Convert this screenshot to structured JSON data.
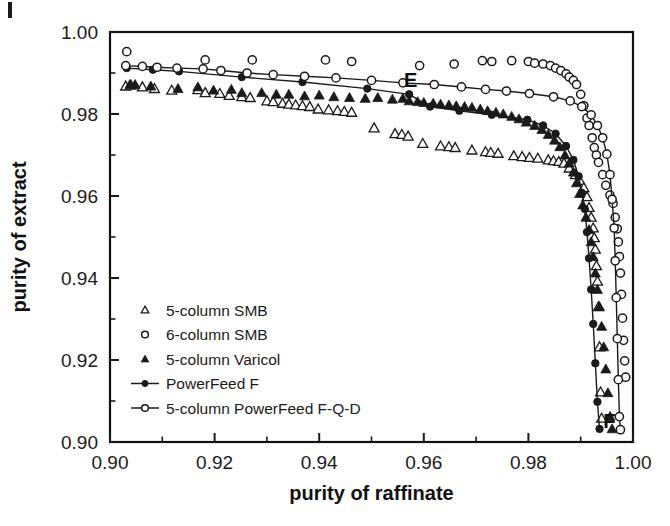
{
  "chart_data": {
    "type": "scatter",
    "title": "",
    "xlabel": "purity of raffinate",
    "ylabel": "purity of extract",
    "xlim": [
      0.9,
      1.0
    ],
    "ylim": [
      0.9,
      1.0
    ],
    "xticks": [
      "0.90",
      "0.92",
      "0.94",
      "0.96",
      "0.98",
      "1.00"
    ],
    "xtick_values": [
      0.9,
      0.92,
      0.94,
      0.96,
      0.98,
      1.0
    ],
    "yticks": [
      "0.90",
      "0.92",
      "0.94",
      "0.96",
      "0.98",
      "1.00"
    ],
    "ytick_values": [
      0.9,
      0.92,
      0.94,
      0.96,
      0.98,
      1.0
    ],
    "minor_tick_step": 0.01,
    "grid": false,
    "legend_position": "lower-left",
    "annotations": [
      {
        "text": "E",
        "x": 0.9575,
        "y": 0.9865
      },
      {
        "text": "F",
        "x": 0.9955,
        "y": 0.9035
      }
    ],
    "series": [
      {
        "name": "5-column SMB",
        "marker": "open-triangle",
        "line": false,
        "points": [
          [
            0.903,
            0.9868
          ],
          [
            0.904,
            0.987
          ],
          [
            0.9062,
            0.9866
          ],
          [
            0.9085,
            0.9862
          ],
          [
            0.9118,
            0.9858
          ],
          [
            0.9168,
            0.9859
          ],
          [
            0.9182,
            0.9852
          ],
          [
            0.921,
            0.985
          ],
          [
            0.9228,
            0.9845
          ],
          [
            0.9252,
            0.9842
          ],
          [
            0.9268,
            0.984
          ],
          [
            0.93,
            0.9832
          ],
          [
            0.9312,
            0.983
          ],
          [
            0.933,
            0.9826
          ],
          [
            0.9342,
            0.9824
          ],
          [
            0.9355,
            0.9822
          ],
          [
            0.9368,
            0.982
          ],
          [
            0.9382,
            0.9818
          ],
          [
            0.9398,
            0.9812
          ],
          [
            0.9418,
            0.981
          ],
          [
            0.9435,
            0.9808
          ],
          [
            0.9448,
            0.9806
          ],
          [
            0.9462,
            0.9804
          ],
          [
            0.9505,
            0.9766
          ],
          [
            0.9545,
            0.9752
          ],
          [
            0.9558,
            0.975
          ],
          [
            0.957,
            0.9746
          ],
          [
            0.9598,
            0.9728
          ],
          [
            0.9632,
            0.9722
          ],
          [
            0.9648,
            0.972
          ],
          [
            0.966,
            0.9718
          ],
          [
            0.9692,
            0.9712
          ],
          [
            0.9718,
            0.9708
          ],
          [
            0.9728,
            0.9706
          ],
          [
            0.9742,
            0.9704
          ],
          [
            0.9772,
            0.9698
          ],
          [
            0.9788,
            0.9696
          ],
          [
            0.9802,
            0.9694
          ],
          [
            0.9818,
            0.9692
          ],
          [
            0.9838,
            0.9688
          ],
          [
            0.9848,
            0.9686
          ],
          [
            0.9858,
            0.9684
          ],
          [
            0.9868,
            0.968
          ],
          [
            0.9878,
            0.9668
          ],
          [
            0.989,
            0.9652
          ],
          [
            0.9898,
            0.9638
          ],
          [
            0.9906,
            0.962
          ],
          [
            0.9912,
            0.9598
          ],
          [
            0.9916,
            0.9572
          ],
          [
            0.992,
            0.9548
          ],
          [
            0.9924,
            0.9522
          ],
          [
            0.9926,
            0.9498
          ],
          [
            0.9928,
            0.947
          ],
          [
            0.993,
            0.943
          ],
          [
            0.9932,
            0.9392
          ],
          [
            0.9934,
            0.933
          ],
          [
            0.9936,
            0.9232
          ],
          [
            0.9938,
            0.9122
          ],
          [
            0.994,
            0.9058
          ]
        ]
      },
      {
        "name": "6-column SMB",
        "marker": "open-circle",
        "line": false,
        "points": [
          [
            0.9032,
            0.9952
          ],
          [
            0.9182,
            0.9932
          ],
          [
            0.9272,
            0.9932
          ],
          [
            0.9412,
            0.9932
          ],
          [
            0.9462,
            0.9928
          ],
          [
            0.9592,
            0.9918
          ],
          [
            0.9658,
            0.9922
          ],
          [
            0.9712,
            0.993
          ],
          [
            0.973,
            0.9928
          ],
          [
            0.9768,
            0.993
          ],
          [
            0.98,
            0.9928
          ],
          [
            0.9812,
            0.9924
          ],
          [
            0.9828,
            0.9922
          ],
          [
            0.9842,
            0.9918
          ],
          [
            0.9852,
            0.9912
          ],
          [
            0.9862,
            0.9906
          ],
          [
            0.9872,
            0.9898
          ],
          [
            0.9878,
            0.989
          ],
          [
            0.9886,
            0.9882
          ],
          [
            0.9892,
            0.9872
          ],
          [
            0.99,
            0.9848
          ],
          [
            0.9906,
            0.982
          ],
          [
            0.9912,
            0.979
          ],
          [
            0.9916,
            0.9772
          ],
          [
            0.9922,
            0.9742
          ],
          [
            0.9926,
            0.9718
          ],
          [
            0.993,
            0.97
          ],
          [
            0.9934,
            0.9682
          ],
          [
            0.9942,
            0.9652
          ],
          [
            0.9948,
            0.9626
          ],
          [
            0.9956,
            0.9602
          ],
          [
            0.9962,
            0.9582
          ],
          [
            0.9966,
            0.9548
          ],
          [
            0.997,
            0.952
          ],
          [
            0.9972,
            0.9488
          ],
          [
            0.9974,
            0.9452
          ],
          [
            0.9976,
            0.9412
          ],
          [
            0.9978,
            0.936
          ],
          [
            0.998,
            0.9302
          ],
          [
            0.9982,
            0.9248
          ],
          [
            0.9984,
            0.9198
          ],
          [
            0.9986,
            0.9158
          ]
        ]
      },
      {
        "name": "5-column Varicol",
        "marker": "filled-triangle",
        "line": false,
        "points": [
          [
            0.9038,
            0.9872
          ],
          [
            0.9048,
            0.9872
          ],
          [
            0.9078,
            0.9868
          ],
          [
            0.913,
            0.9862
          ],
          [
            0.9168,
            0.9866
          ],
          [
            0.9198,
            0.9858
          ],
          [
            0.9232,
            0.986
          ],
          [
            0.9252,
            0.9852
          ],
          [
            0.929,
            0.9852
          ],
          [
            0.9318,
            0.9848
          ],
          [
            0.9342,
            0.9848
          ],
          [
            0.9372,
            0.9844
          ],
          [
            0.94,
            0.9846
          ],
          [
            0.9428,
            0.9842
          ],
          [
            0.9458,
            0.984
          ],
          [
            0.9488,
            0.9838
          ],
          [
            0.9512,
            0.984
          ],
          [
            0.954,
            0.9836
          ],
          [
            0.956,
            0.9838
          ],
          [
            0.9572,
            0.9832
          ],
          [
            0.9588,
            0.983
          ],
          [
            0.96,
            0.9828
          ],
          [
            0.9618,
            0.9826
          ],
          [
            0.9632,
            0.9824
          ],
          [
            0.9648,
            0.9822
          ],
          [
            0.9662,
            0.982
          ],
          [
            0.9678,
            0.9818
          ],
          [
            0.9692,
            0.9816
          ],
          [
            0.9708,
            0.9812
          ],
          [
            0.9722,
            0.9808
          ],
          [
            0.9738,
            0.9804
          ],
          [
            0.9752,
            0.98
          ],
          [
            0.9768,
            0.9794
          ],
          [
            0.9782,
            0.9788
          ],
          [
            0.9796,
            0.978
          ],
          [
            0.9812,
            0.9772
          ],
          [
            0.9826,
            0.9762
          ],
          [
            0.9838,
            0.975
          ],
          [
            0.985,
            0.9736
          ],
          [
            0.986,
            0.972
          ],
          [
            0.987,
            0.97
          ],
          [
            0.9878,
            0.968
          ],
          [
            0.9886,
            0.9658
          ],
          [
            0.9892,
            0.9632
          ],
          [
            0.9898,
            0.9606
          ],
          [
            0.9904,
            0.9578
          ],
          [
            0.991,
            0.9548
          ],
          [
            0.9916,
            0.9518
          ],
          [
            0.992,
            0.9488
          ],
          [
            0.9924,
            0.9452
          ],
          [
            0.9928,
            0.9412
          ],
          [
            0.9932,
            0.9372
          ],
          [
            0.9936,
            0.933
          ],
          [
            0.994,
            0.9282
          ],
          [
            0.9944,
            0.9232
          ],
          [
            0.9948,
            0.9178
          ],
          [
            0.9952,
            0.912
          ],
          [
            0.9956,
            0.9062
          ],
          [
            0.996,
            0.9032
          ]
        ]
      },
      {
        "name": "PowerFeed F",
        "marker": "filled-circle",
        "line": true,
        "points": [
          [
            0.9032,
            0.9912
          ],
          [
            0.9082,
            0.9908
          ],
          [
            0.9132,
            0.9904
          ],
          [
            0.9252,
            0.989
          ],
          [
            0.9368,
            0.9878
          ],
          [
            0.9492,
            0.9862
          ],
          [
            0.9572,
            0.9848
          ],
          [
            0.9612,
            0.9818
          ],
          [
            0.9668,
            0.9808
          ],
          [
            0.973,
            0.9798
          ],
          [
            0.9798,
            0.9786
          ],
          [
            0.9828,
            0.9772
          ],
          [
            0.9852,
            0.9752
          ],
          [
            0.9872,
            0.9722
          ],
          [
            0.9886,
            0.9688
          ],
          [
            0.9896,
            0.9648
          ],
          [
            0.9902,
            0.9608
          ],
          [
            0.9908,
            0.9568
          ],
          [
            0.9912,
            0.9512
          ],
          [
            0.9916,
            0.9448
          ],
          [
            0.992,
            0.9372
          ],
          [
            0.9924,
            0.9288
          ],
          [
            0.9928,
            0.9192
          ],
          [
            0.9932,
            0.9098
          ],
          [
            0.9936,
            0.9032
          ]
        ]
      },
      {
        "name": "5-column PowerFeed F-Q-D",
        "marker": "open-circle",
        "line": true,
        "points": [
          [
            0.903,
            0.9918
          ],
          [
            0.9062,
            0.9916
          ],
          [
            0.909,
            0.9914
          ],
          [
            0.9128,
            0.9912
          ],
          [
            0.9178,
            0.991
          ],
          [
            0.9212,
            0.9906
          ],
          [
            0.9262,
            0.99
          ],
          [
            0.9312,
            0.9896
          ],
          [
            0.9372,
            0.9892
          ],
          [
            0.9432,
            0.9888
          ],
          [
            0.95,
            0.9882
          ],
          [
            0.956,
            0.9876
          ],
          [
            0.962,
            0.9872
          ],
          [
            0.9672,
            0.9866
          ],
          [
            0.9718,
            0.986
          ],
          [
            0.9758,
            0.9856
          ],
          [
            0.9802,
            0.985
          ],
          [
            0.9848,
            0.9842
          ],
          [
            0.988,
            0.9832
          ],
          [
            0.9902,
            0.9818
          ],
          [
            0.992,
            0.9798
          ],
          [
            0.9932,
            0.9772
          ],
          [
            0.9942,
            0.9742
          ],
          [
            0.995,
            0.9702
          ],
          [
            0.9956,
            0.9652
          ],
          [
            0.996,
            0.9592
          ],
          [
            0.9964,
            0.9522
          ],
          [
            0.9966,
            0.9442
          ],
          [
            0.9968,
            0.9352
          ],
          [
            0.997,
            0.9252
          ],
          [
            0.9972,
            0.9152
          ],
          [
            0.9974,
            0.9062
          ],
          [
            0.9976,
            0.903
          ]
        ]
      }
    ]
  },
  "legend": {
    "entries": [
      {
        "label": "5-column SMB",
        "marker": "open-triangle",
        "line": false
      },
      {
        "label": "6-column SMB",
        "marker": "open-circle",
        "line": false
      },
      {
        "label": "5-column Varicol",
        "marker": "filled-triangle",
        "line": false
      },
      {
        "label": "PowerFeed F",
        "marker": "filled-circle",
        "line": true
      },
      {
        "label": "5-column PowerFeed F-Q-D",
        "marker": "open-circle",
        "line": true
      }
    ]
  },
  "colors": {
    "ink": "#1a1a1a",
    "axis": "#111111",
    "background": "#ffffff"
  }
}
